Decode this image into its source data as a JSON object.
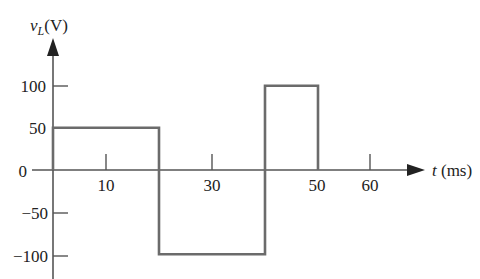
{
  "chart_data": {
    "type": "line",
    "title": "",
    "ylabel": "v_L(V)",
    "ylabel_main": "v",
    "ylabel_sub": "L",
    "ylabel_unit": "(V)",
    "xlabel": "t (ms)",
    "xlabel_var": "t",
    "xlabel_unit": "(ms)",
    "x_ticks": [
      10,
      30,
      50,
      60
    ],
    "x_tick_labels": [
      "10",
      "30",
      "50",
      "60"
    ],
    "y_ticks": [
      100,
      50,
      0,
      -50,
      -100
    ],
    "y_tick_labels": [
      "100",
      "50",
      "0",
      "−50",
      "−100"
    ],
    "xlim": [
      0,
      70
    ],
    "ylim": [
      -115,
      130
    ],
    "grid": false,
    "legend": "none",
    "series": [
      {
        "name": "v_L",
        "step": true,
        "x": [
          0,
          0,
          20,
          20,
          40,
          40,
          50,
          50
        ],
        "values": [
          0,
          50,
          50,
          -100,
          -100,
          100,
          100,
          0
        ]
      }
    ],
    "line_color": "#6b6b6b",
    "axis_color": "#555555"
  }
}
